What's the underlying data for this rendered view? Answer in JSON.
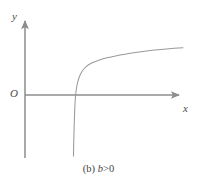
{
  "figure": {
    "caption_full": "(b) b>0",
    "caption_index": "(b)",
    "caption_variable": "b",
    "caption_relation": ">0",
    "background_color": "#ffffff",
    "axis_color": "#8c8c8c",
    "curve_color": "#999999",
    "label_color": "#4a4a4a"
  },
  "axes": {
    "y_label": "y",
    "x_label": "x",
    "origin_label": "O",
    "x_axis": {
      "start_px": [
        25,
        95
      ],
      "end_px": [
        182,
        95
      ],
      "has_arrow": true
    },
    "y_axis": {
      "start_px": [
        25,
        158
      ],
      "end_px": [
        25,
        18
      ],
      "has_arrow": true
    }
  },
  "chart_data": {
    "type": "line",
    "xlabel": "x",
    "ylabel": "y",
    "grid": false,
    "legend": null,
    "annotations": [
      "O"
    ],
    "asymptote_x_px": 72,
    "x_intercept_px": 75,
    "series": [
      {
        "name": "y = log(x - b)",
        "points_px": [
          [
            73.5,
            156
          ],
          [
            73.6,
            148
          ],
          [
            73.8,
            140
          ],
          [
            74.0,
            132
          ],
          [
            74.2,
            124
          ],
          [
            74.5,
            116
          ],
          [
            74.8,
            108
          ],
          [
            75.2,
            100
          ],
          [
            75.6,
            95
          ],
          [
            76.2,
            90
          ],
          [
            77.0,
            85
          ],
          [
            78.2,
            80
          ],
          [
            80.0,
            75
          ],
          [
            82.5,
            70.5
          ],
          [
            86.0,
            66.5
          ],
          [
            90.5,
            63.5
          ],
          [
            96.0,
            61.0
          ],
          [
            103.0,
            58.8
          ],
          [
            111.0,
            56.8
          ],
          [
            120.0,
            55.0
          ],
          [
            130.0,
            53.3
          ],
          [
            141.0,
            51.7
          ],
          [
            152.0,
            50.3
          ],
          [
            164.0,
            49.2
          ],
          [
            174.0,
            48.4
          ],
          [
            183.0,
            47.8
          ]
        ]
      }
    ]
  }
}
